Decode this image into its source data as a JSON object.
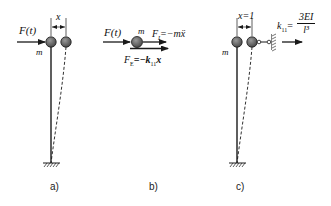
{
  "figure": {
    "panels": [
      {
        "id": "a",
        "caption": "a)",
        "force_label": "F(t)",
        "mass_label": "m",
        "displacement_label": "x"
      },
      {
        "id": "b",
        "caption": "b)",
        "force_label": "F(t)",
        "mass_label": "m",
        "inertia_force_label": "F",
        "inertia_force_sub": "I",
        "inertia_force_expr": "=−mẍ",
        "elastic_force_label": "F",
        "elastic_force_sub": "E",
        "elastic_force_expr": "=−k",
        "elastic_force_k_sub": "11",
        "elastic_force_var": "x"
      },
      {
        "id": "c",
        "caption": "c)",
        "mass_label": "m",
        "displacement_label": "x=1",
        "stiffness_label": "k",
        "stiffness_sub": "11",
        "stiffness_eq": "=",
        "stiffness_numerator": "3EI",
        "stiffness_denominator": "l³"
      }
    ],
    "colors": {
      "line": "#1a1a1a",
      "mass_fill": "#6b6b6b",
      "background": "#ffffff"
    }
  }
}
